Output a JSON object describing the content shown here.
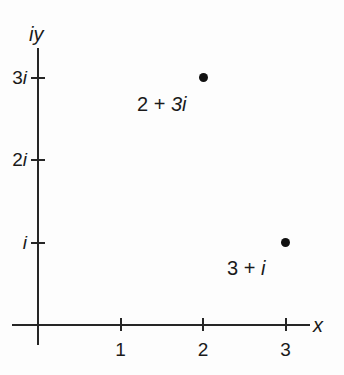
{
  "figure": {
    "background_color": "#fdfdfd",
    "ink_color": "#262626"
  },
  "chart_data": {
    "type": "scatter",
    "title": "",
    "xlabel": "x",
    "ylabel": "iy",
    "xlim": [
      -0.3,
      3.6
    ],
    "ylim": [
      -0.35,
      3.6
    ],
    "grid": false,
    "legend": null,
    "x_ticks": [
      {
        "value": 1,
        "label": "1"
      },
      {
        "value": 2,
        "label": "2"
      },
      {
        "value": 3,
        "label": "3"
      }
    ],
    "y_ticks": [
      {
        "value": 1,
        "label": "i"
      },
      {
        "value": 2,
        "label": "2i"
      },
      {
        "value": 3,
        "label": "3i"
      }
    ],
    "points": [
      {
        "x": 2,
        "y": 3,
        "label_real": "2",
        "label_op": "+",
        "label_imag": "3i",
        "label": "2 + 3i"
      },
      {
        "x": 3,
        "y": 1,
        "label_real": "3",
        "label_op": "+",
        "label_imag": "i",
        "label": "3 + i"
      }
    ]
  }
}
